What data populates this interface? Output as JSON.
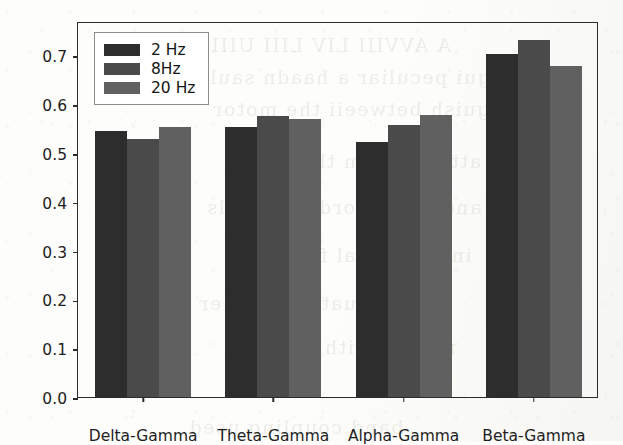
{
  "chart_data": {
    "type": "bar",
    "title": "",
    "xlabel": "",
    "ylabel": "AUC",
    "ylim": [
      0.0,
      0.77
    ],
    "ytick_values": [
      0.0,
      0.1,
      0.2,
      0.3,
      0.4,
      0.5,
      0.6,
      0.7
    ],
    "ytick_labels": [
      "0.0",
      "0.1",
      "0.2",
      "0.3",
      "0.4",
      "0.5",
      "0.6",
      "0.7"
    ],
    "grid": false,
    "legend_position": "upper left",
    "categories": [
      "Delta-Gamma",
      "Theta-Gamma",
      "Alpha-Gamma",
      "Beta-Gamma"
    ],
    "series": [
      {
        "name": "2 Hz",
        "color": "#2d2d2d",
        "values": [
          0.545,
          0.552,
          0.522,
          0.702
        ]
      },
      {
        "name": "8Hz",
        "color": "#4a4a4a",
        "values": [
          0.528,
          0.576,
          0.557,
          0.731
        ]
      },
      {
        "name": "20 Hz",
        "color": "#606060",
        "values": [
          0.552,
          0.57,
          0.578,
          0.678
        ]
      }
    ]
  },
  "figure": {
    "background_color": "#fdfdfb",
    "axis_color": "#2b2b2b",
    "text_color": "#1e1e1e"
  },
  "ghost_text": {
    "lines": [
      "A AVVIII LIV LIII UIII",
      "ngui peculiar a haadn saula",
      "tinguish betweeii the motor",
      "atterns from these two",
      "and the recorded signals",
      "input neural features",
      "evaluate classifier",
      "results with higher",
      "band coupling used"
    ]
  }
}
